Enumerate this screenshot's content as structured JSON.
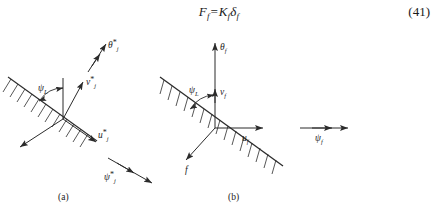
{
  "equation": {
    "number": "(41)",
    "lhs_symbol": "F",
    "lhs_sub": "f",
    "eq": "=",
    "rhs_symbol": "K",
    "rhs_sub": "f",
    "rhs_symbol2": "δ",
    "rhs_sub2": "f"
  },
  "figure": {
    "panel_a": {
      "caption": "(a)",
      "labels": {
        "theta": "θ",
        "theta_star": "*",
        "theta_sub": "j",
        "v": "v",
        "v_star": "*",
        "v_sub": "j",
        "u": "u",
        "u_star": "*",
        "u_sub": "j",
        "psi_moment": "ψ",
        "psi_moment_star": "*",
        "psi_moment_sub": "j",
        "psi_angle": "ψ",
        "psi_angle_sub": "L"
      }
    },
    "panel_b": {
      "caption": "(b)",
      "labels": {
        "theta": "θ",
        "theta_sub": "f",
        "v": "v",
        "v_sub": "f",
        "u": "u",
        "u_sub": "f",
        "psi_moment": "ψ",
        "psi_moment_sub": "f",
        "psi_angle": "ψ",
        "psi_angle_sub": "L",
        "force": "f"
      }
    }
  },
  "colors": {
    "ink": "#2b2b2b",
    "background": "#ffffff"
  }
}
